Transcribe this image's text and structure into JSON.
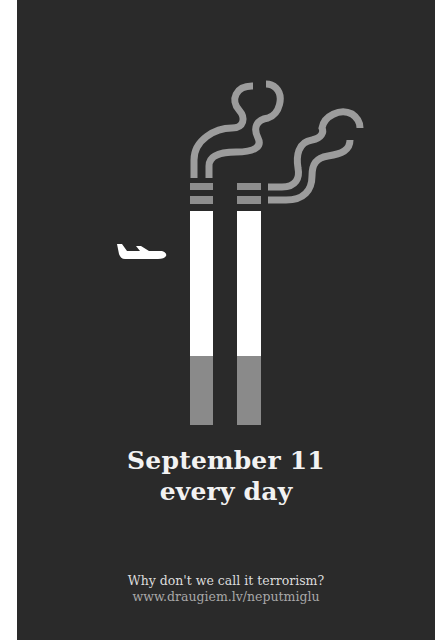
{
  "poster": {
    "headline_line1": "September 11",
    "headline_line2": "every day",
    "question": "Why don't we call it terrorism?",
    "url": "www.draugiem.lv/neputmiglu"
  },
  "illustration": {
    "icons": [
      "airplane-icon",
      "cigarette-icon",
      "cigarette-icon",
      "smoke-icon"
    ],
    "colors": {
      "background": "#2a2a2a",
      "cigarette_paper": "#ffffff",
      "filter": "#8a8a8a",
      "band": "#8e8e8e",
      "smoke": "#9c9c9c",
      "text": "#f2f2f2"
    }
  }
}
